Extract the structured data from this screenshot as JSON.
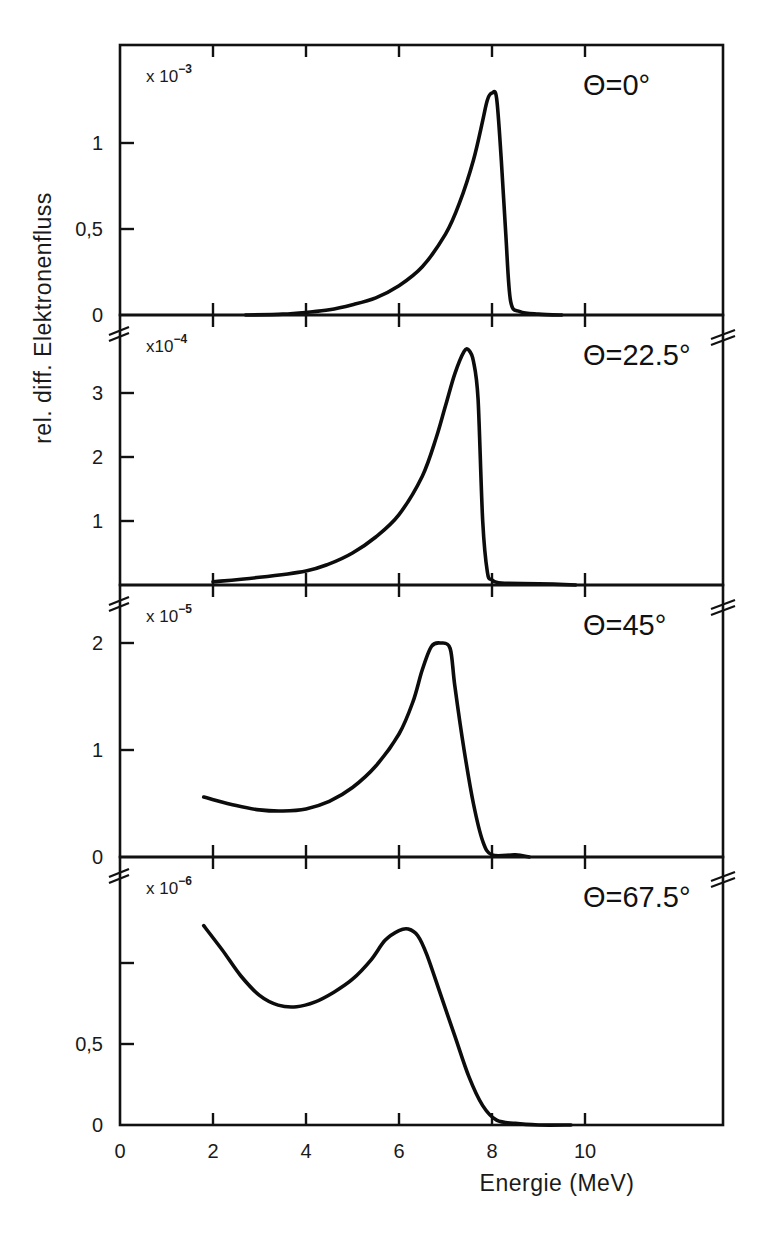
{
  "figure": {
    "ylabel": "rel. diff. Elektronenfluss",
    "xlabel": "Energie (MeV)",
    "x_tick_labels": [
      "0",
      "2",
      "4",
      "6",
      "8",
      "10"
    ],
    "panels": [
      {
        "angle_label": "Θ=0°",
        "scale_prefix": "x 10",
        "scale_exponent": "−3",
        "y_tick_labels": [
          "0",
          "0,5",
          "1"
        ]
      },
      {
        "angle_label": "Θ=22.5°",
        "scale_prefix": "x10",
        "scale_exponent": "−4",
        "y_tick_labels": [
          "1",
          "2",
          "3"
        ]
      },
      {
        "angle_label": "Θ=45°",
        "scale_prefix": "x 10",
        "scale_exponent": "−5",
        "y_tick_labels": [
          "0",
          "1",
          "2"
        ]
      },
      {
        "angle_label": "Θ=67.5°",
        "scale_prefix": "x 10",
        "scale_exponent": "−6",
        "y_tick_labels": [
          "0",
          "0,5"
        ]
      }
    ]
  },
  "chart_data": [
    {
      "type": "line",
      "title": "Θ=0°",
      "xlabel": "Energie (MeV)",
      "ylabel": "rel. diff. Elektronenfluss",
      "y_scale_factor": "x 10^-3",
      "xlim": [
        0,
        13
      ],
      "ylim": [
        0,
        1.57
      ],
      "x_ticks": [
        0,
        2,
        4,
        6,
        8,
        10
      ],
      "y_ticks": [
        0,
        0.5,
        1
      ],
      "grid": false,
      "x": [
        2.7,
        3.5,
        4.0,
        4.5,
        5.0,
        5.5,
        6.0,
        6.5,
        7.0,
        7.3,
        7.6,
        7.8,
        7.9,
        8.0,
        8.1,
        8.2,
        8.3,
        8.4,
        8.6,
        9.0,
        9.5
      ],
      "y": [
        0.0,
        0.005,
        0.015,
        0.03,
        0.06,
        0.1,
        0.17,
        0.28,
        0.47,
        0.65,
        0.9,
        1.13,
        1.25,
        1.29,
        1.26,
        0.9,
        0.45,
        0.08,
        0.02,
        0.005,
        0.0
      ]
    },
    {
      "type": "line",
      "title": "Θ=22.5°",
      "xlabel": "Energie (MeV)",
      "ylabel": "rel. diff. Elektronenfluss",
      "y_scale_factor": "x 10^-4",
      "xlim": [
        0,
        13
      ],
      "ylim": [
        0,
        4.2
      ],
      "x_ticks": [
        0,
        2,
        4,
        6,
        8,
        10
      ],
      "y_ticks": [
        1,
        2,
        3
      ],
      "grid": false,
      "x": [
        2.0,
        3.0,
        4.0,
        4.5,
        5.0,
        5.5,
        6.0,
        6.5,
        6.8,
        7.0,
        7.2,
        7.4,
        7.5,
        7.6,
        7.7,
        7.8,
        7.9,
        8.0,
        8.2,
        9.0,
        9.8
      ],
      "y": [
        0.05,
        0.12,
        0.22,
        0.33,
        0.5,
        0.75,
        1.1,
        1.7,
        2.3,
        2.8,
        3.3,
        3.65,
        3.67,
        3.5,
        2.9,
        1.0,
        0.2,
        0.08,
        0.03,
        0.02,
        0.0
      ]
    },
    {
      "type": "line",
      "title": "Θ=45°",
      "xlabel": "Energie (MeV)",
      "ylabel": "rel. diff. Elektronenfluss",
      "y_scale_factor": "x 10^-5",
      "xlim": [
        0,
        13
      ],
      "ylim": [
        0,
        2.55
      ],
      "x_ticks": [
        0,
        2,
        4,
        6,
        8,
        10
      ],
      "y_ticks": [
        0,
        1,
        2
      ],
      "grid": false,
      "x": [
        1.8,
        2.5,
        3.0,
        3.5,
        4.0,
        4.5,
        5.0,
        5.5,
        6.0,
        6.3,
        6.5,
        6.7,
        6.9,
        7.1,
        7.2,
        7.4,
        7.6,
        7.8,
        8.0,
        8.5,
        8.8
      ],
      "y": [
        0.56,
        0.48,
        0.44,
        0.43,
        0.45,
        0.52,
        0.65,
        0.85,
        1.15,
        1.45,
        1.75,
        1.97,
        2.0,
        1.95,
        1.6,
        1.0,
        0.5,
        0.15,
        0.02,
        0.02,
        0.0
      ]
    },
    {
      "type": "line",
      "title": "Θ=67.5°",
      "xlabel": "Energie (MeV)",
      "ylabel": "rel. diff. Elektronenfluss",
      "y_scale_factor": "x 10^-6",
      "xlim": [
        0,
        13
      ],
      "ylim": [
        0,
        1.65
      ],
      "x_ticks": [
        0,
        2,
        4,
        6,
        8,
        10
      ],
      "y_ticks": [
        0,
        0.5
      ],
      "grid": false,
      "x": [
        1.8,
        2.2,
        2.6,
        3.0,
        3.4,
        3.8,
        4.2,
        4.6,
        5.0,
        5.4,
        5.7,
        6.0,
        6.2,
        6.4,
        6.6,
        6.9,
        7.2,
        7.5,
        7.8,
        8.1,
        8.5,
        9.0,
        9.7
      ],
      "y": [
        1.23,
        1.08,
        0.92,
        0.8,
        0.74,
        0.73,
        0.76,
        0.82,
        0.9,
        1.02,
        1.14,
        1.2,
        1.21,
        1.17,
        1.05,
        0.8,
        0.55,
        0.3,
        0.12,
        0.03,
        0.01,
        0.0,
        0.0
      ]
    }
  ]
}
